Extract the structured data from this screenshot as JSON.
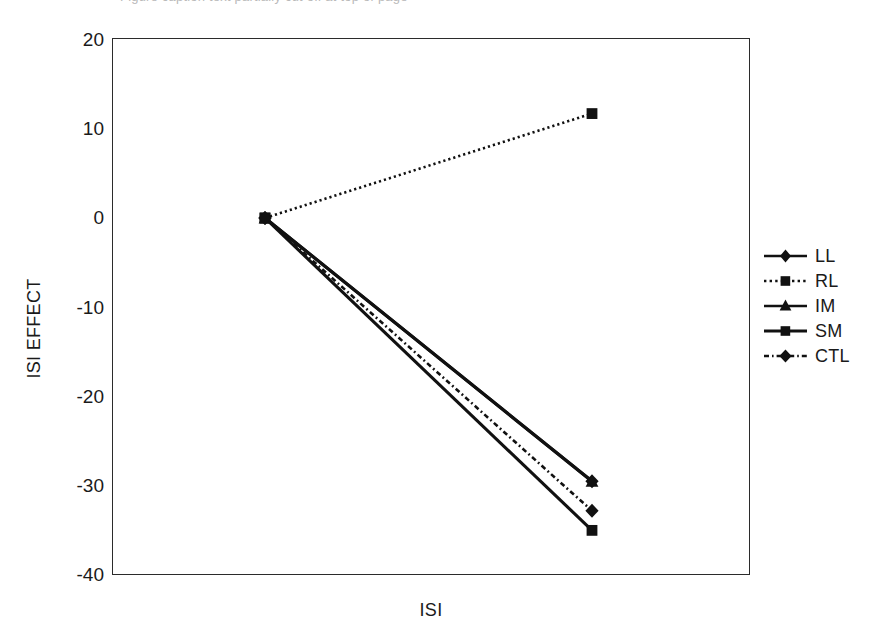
{
  "figure": {
    "cut_caption": "Figure caption text partially cut off at top of page",
    "background": "#ffffff",
    "ink_color": "#1a1a1a"
  },
  "axes": {
    "xlabel": "ISI",
    "ylabel": "ISI EFFECT",
    "yticks": [
      "20",
      "10",
      "0",
      "-10",
      "-20",
      "-30",
      "-40"
    ]
  },
  "legend": {
    "entries": [
      {
        "label": "LL",
        "style": "solid",
        "marker": "diamond"
      },
      {
        "label": "RL",
        "style": "dotted",
        "marker": "square"
      },
      {
        "label": "IM",
        "style": "solid",
        "marker": "triangle"
      },
      {
        "label": "SM",
        "style": "solid",
        "marker": "square"
      },
      {
        "label": "CTL",
        "style": "dash-dot",
        "marker": "diamond"
      }
    ]
  },
  "chart_data": {
    "type": "line",
    "title": "",
    "xlabel": "ISI",
    "ylabel": "ISI EFFECT",
    "ylim": [
      -40,
      20
    ],
    "ytick_values": [
      20,
      10,
      0,
      -10,
      -20,
      -30,
      -40
    ],
    "grid": false,
    "legend_position": "right",
    "x": [
      1,
      2
    ],
    "xtick_labels": [
      "",
      ""
    ],
    "series": [
      {
        "name": "LL",
        "values": [
          0,
          -29.5
        ],
        "style": "solid",
        "marker": "diamond"
      },
      {
        "name": "RL",
        "values": [
          0,
          11.7
        ],
        "style": "dotted",
        "marker": "square"
      },
      {
        "name": "IM",
        "values": [
          0,
          -29.5
        ],
        "style": "solid",
        "marker": "triangle"
      },
      {
        "name": "SM",
        "values": [
          0,
          -35.0
        ],
        "style": "solid",
        "marker": "square"
      },
      {
        "name": "CTL",
        "values": [
          0,
          -32.8
        ],
        "style": "dash-dot",
        "marker": "diamond"
      }
    ]
  }
}
